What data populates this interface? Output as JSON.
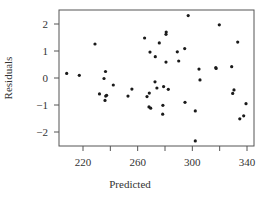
{
  "chart_data": {
    "type": "scatter",
    "title": "",
    "xlabel": "Predicted",
    "ylabel": "Residuals",
    "xlim": [
      207,
      343
    ],
    "ylim": [
      -2.5,
      2.5
    ],
    "xticks": [
      220,
      240,
      260,
      280,
      300,
      320,
      340
    ],
    "xtick_labels": [
      "220",
      "260",
      "300",
      "340"
    ],
    "xtick_labeled_values": [
      220,
      260,
      300,
      340
    ],
    "yticks": [
      2,
      1,
      0,
      -1,
      -2
    ],
    "ytick_labels": [
      "2",
      "1",
      "0",
      "−1",
      "−2"
    ],
    "grid": false,
    "legend": null,
    "point_color": "#1a1a1a",
    "points": [
      {
        "x": 208.1,
        "y": 0.17
      },
      {
        "x": 217.3,
        "y": 0.1
      },
      {
        "x": 228.8,
        "y": 1.26
      },
      {
        "x": 236.5,
        "y": 0.24
      },
      {
        "x": 235.4,
        "y": -0.02
      },
      {
        "x": 242.2,
        "y": -0.26
      },
      {
        "x": 232.1,
        "y": -0.59
      },
      {
        "x": 237.3,
        "y": -0.64
      },
      {
        "x": 236.6,
        "y": -0.67
      },
      {
        "x": 236.1,
        "y": -0.83
      },
      {
        "x": 255.8,
        "y": -0.41
      },
      {
        "x": 252.9,
        "y": -0.67
      },
      {
        "x": 265.1,
        "y": 1.48
      },
      {
        "x": 269.0,
        "y": 0.96
      },
      {
        "x": 272.9,
        "y": 0.79
      },
      {
        "x": 275.8,
        "y": 1.3
      },
      {
        "x": 280.9,
        "y": 1.7
      },
      {
        "x": 280.7,
        "y": 1.62
      },
      {
        "x": 280.7,
        "y": 0.59
      },
      {
        "x": 289.0,
        "y": 0.97
      },
      {
        "x": 290.0,
        "y": 0.63
      },
      {
        "x": 294.4,
        "y": 1.09
      },
      {
        "x": 297.0,
        "y": 2.31
      },
      {
        "x": 272.7,
        "y": -0.14
      },
      {
        "x": 274.1,
        "y": -0.37
      },
      {
        "x": 279.0,
        "y": -0.32
      },
      {
        "x": 282.4,
        "y": -0.42
      },
      {
        "x": 268.5,
        "y": -0.56
      },
      {
        "x": 266.8,
        "y": -0.69
      },
      {
        "x": 268.3,
        "y": -1.07
      },
      {
        "x": 269.5,
        "y": -1.12
      },
      {
        "x": 278.5,
        "y": -1.01
      },
      {
        "x": 278.3,
        "y": -1.34
      },
      {
        "x": 294.6,
        "y": -0.9
      },
      {
        "x": 302.2,
        "y": -1.22
      },
      {
        "x": 302.2,
        "y": -2.33
      },
      {
        "x": 304.9,
        "y": 0.33
      },
      {
        "x": 305.6,
        "y": -0.07
      },
      {
        "x": 317.4,
        "y": 0.35
      },
      {
        "x": 317.2,
        "y": 0.39
      },
      {
        "x": 319.7,
        "y": 1.97
      },
      {
        "x": 328.8,
        "y": 0.42
      },
      {
        "x": 330.5,
        "y": -0.44
      },
      {
        "x": 329.5,
        "y": -0.57
      },
      {
        "x": 333.2,
        "y": 1.33
      },
      {
        "x": 339.3,
        "y": -0.95
      },
      {
        "x": 337.6,
        "y": -1.4
      },
      {
        "x": 334.7,
        "y": -1.51
      }
    ]
  }
}
